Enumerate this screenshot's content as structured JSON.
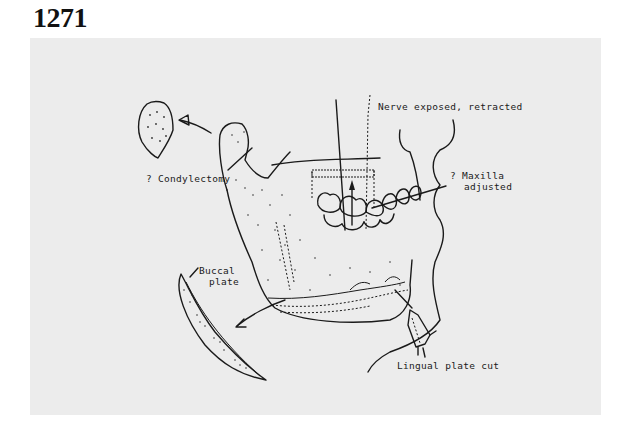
{
  "figure": {
    "number": "1271",
    "background_color": "#ececec",
    "line_color": "#1a1a1a"
  },
  "labels": {
    "condylectomy": "? Condylectomy",
    "nerve": "Nerve exposed, retracted",
    "maxilla_line1": "? Maxilla",
    "maxilla_line2": "adjusted",
    "buccal_line1": "Buccal",
    "buccal_line2": "plate",
    "lingual": "Lingual plate cut"
  }
}
